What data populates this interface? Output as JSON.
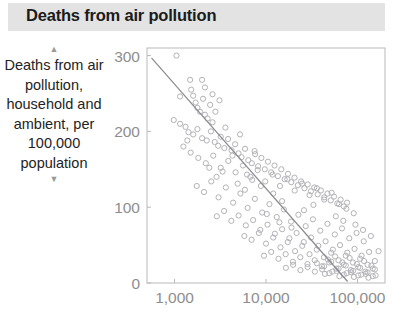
{
  "header": {
    "title": "Deaths from air pollution"
  },
  "axis_caption": {
    "text": "Deaths from air pollution, household and ambient, per 100,000 population",
    "arrow_up": "▲",
    "arrow_down": "▼"
  },
  "colors": {
    "title_band": "#e3e3e3",
    "title_text": "#1b1b1b",
    "tick_label": "#8e8e8e",
    "axis": "#b9b9b9",
    "point": "#b3b3b8",
    "trend_line": "#8a8a90",
    "background": "#ffffff"
  },
  "chart_data": {
    "type": "scatter",
    "title": "Deaths from air pollution",
    "xlabel": "",
    "ylabel": "Deaths from air pollution, household and ambient, per 100,000 population",
    "x_scale": "log",
    "y_scale": "linear",
    "xlim": [
      500,
      200000
    ],
    "ylim": [
      0,
      310
    ],
    "x_ticks": [
      1000,
      10000,
      100000
    ],
    "x_tick_labels": [
      "1,000",
      "10,000",
      "100,000"
    ],
    "y_ticks": [
      0,
      100,
      200,
      300
    ],
    "y_tick_labels": [
      "0",
      "100",
      "200",
      "300"
    ],
    "grid": false,
    "legend": null,
    "trend_line": {
      "type": "linear-in-log-x",
      "x_start": 560,
      "y_start": 297,
      "x_end": 78000,
      "y_end": 2
    },
    "series": [
      {
        "name": "countries",
        "marker": "open-circle",
        "points": [
          [
            1050,
            300
          ],
          [
            1480,
            268
          ],
          [
            1520,
            255
          ],
          [
            1600,
            247
          ],
          [
            1700,
            238
          ],
          [
            1780,
            231
          ],
          [
            1900,
            226
          ],
          [
            2050,
            243
          ],
          [
            2150,
            222
          ],
          [
            2300,
            217
          ],
          [
            2450,
            235
          ],
          [
            2600,
            212
          ],
          [
            980,
            215
          ],
          [
            1150,
            210
          ],
          [
            1320,
            206
          ],
          [
            1420,
            199
          ],
          [
            1600,
            196
          ],
          [
            1780,
            203
          ],
          [
            2000,
            191
          ],
          [
            2250,
            188
          ],
          [
            2500,
            200
          ],
          [
            2750,
            186
          ],
          [
            3000,
            181
          ],
          [
            3200,
            193
          ],
          [
            3500,
            178
          ],
          [
            3850,
            190
          ],
          [
            4200,
            175
          ],
          [
            4600,
            183
          ],
          [
            5000,
            171
          ],
          [
            5400,
            166
          ],
          [
            5900,
            177
          ],
          [
            6400,
            162
          ],
          [
            7000,
            158
          ],
          [
            7600,
            170
          ],
          [
            8200,
            154
          ],
          [
            8900,
            165
          ],
          [
            9700,
            150
          ],
          [
            10500,
            160
          ],
          [
            11400,
            146
          ],
          [
            12400,
            155
          ],
          [
            13500,
            141
          ],
          [
            14700,
            150
          ],
          [
            16000,
            137
          ],
          [
            17400,
            144
          ],
          [
            18900,
            133
          ],
          [
            20500,
            139
          ],
          [
            22300,
            129
          ],
          [
            24200,
            134
          ],
          [
            26300,
            125
          ],
          [
            28600,
            130
          ],
          [
            31000,
            121
          ],
          [
            33700,
            126
          ],
          [
            36700,
            117
          ],
          [
            39800,
            122
          ],
          [
            43300,
            113
          ],
          [
            47000,
            118
          ],
          [
            51000,
            109
          ],
          [
            55400,
            114
          ],
          [
            60200,
            105
          ],
          [
            65400,
            110
          ],
          [
            71000,
            101
          ],
          [
            77000,
            106
          ],
          [
            1250,
            180
          ],
          [
            1500,
            172
          ],
          [
            1820,
            165
          ],
          [
            2200,
            158
          ],
          [
            2650,
            168
          ],
          [
            3200,
            152
          ],
          [
            3870,
            161
          ],
          [
            4650,
            146
          ],
          [
            5600,
            155
          ],
          [
            6750,
            140
          ],
          [
            8100,
            149
          ],
          [
            9800,
            134
          ],
          [
            11800,
            143
          ],
          [
            14200,
            128
          ],
          [
            17100,
            137
          ],
          [
            20600,
            122
          ],
          [
            24800,
            131
          ],
          [
            29900,
            116
          ],
          [
            36000,
            125
          ],
          [
            43300,
            110
          ],
          [
            52200,
            119
          ],
          [
            62900,
            104
          ],
          [
            75700,
            98
          ],
          [
            91000,
            92
          ],
          [
            1750,
            128
          ],
          [
            2100,
            120
          ],
          [
            2520,
            134
          ],
          [
            3030,
            113
          ],
          [
            3640,
            126
          ],
          [
            4370,
            106
          ],
          [
            5250,
            118
          ],
          [
            6300,
            99
          ],
          [
            7560,
            111
          ],
          [
            9080,
            93
          ],
          [
            10900,
            104
          ],
          [
            13100,
            87
          ],
          [
            15700,
            97
          ],
          [
            18800,
            81
          ],
          [
            22600,
            90
          ],
          [
            27200,
            75
          ],
          [
            32600,
            84
          ],
          [
            39200,
            69
          ],
          [
            47000,
            78
          ],
          [
            56500,
            64
          ],
          [
            67800,
            72
          ],
          [
            81400,
            59
          ],
          [
            97700,
            66
          ],
          [
            117000,
            55
          ],
          [
            2900,
            88
          ],
          [
            3480,
            95
          ],
          [
            4180,
            82
          ],
          [
            5020,
            89
          ],
          [
            6020,
            76
          ],
          [
            7230,
            83
          ],
          [
            8670,
            70
          ],
          [
            10400,
            77
          ],
          [
            12500,
            65
          ],
          [
            15000,
            71
          ],
          [
            18000,
            59
          ],
          [
            21600,
            66
          ],
          [
            25900,
            54
          ],
          [
            31100,
            60
          ],
          [
            37300,
            49
          ],
          [
            44800,
            55
          ],
          [
            53800,
            44
          ],
          [
            64500,
            50
          ],
          [
            77400,
            40
          ],
          [
            92900,
            45
          ],
          [
            111000,
            36
          ],
          [
            134000,
            41
          ],
          [
            5800,
            62
          ],
          [
            6960,
            57
          ],
          [
            8350,
            66
          ],
          [
            10000,
            52
          ],
          [
            12000,
            60
          ],
          [
            14400,
            47
          ],
          [
            17300,
            54
          ],
          [
            20800,
            42
          ],
          [
            24900,
            49
          ],
          [
            29900,
            38
          ],
          [
            35900,
            44
          ],
          [
            43000,
            34
          ],
          [
            51600,
            40
          ],
          [
            62000,
            30
          ],
          [
            74400,
            36
          ],
          [
            89200,
            27
          ],
          [
            107000,
            32
          ],
          [
            129000,
            24
          ],
          [
            155000,
            29
          ],
          [
            9500,
            36
          ],
          [
            11400,
            41
          ],
          [
            13700,
            32
          ],
          [
            16400,
            38
          ],
          [
            19700,
            28
          ],
          [
            23700,
            34
          ],
          [
            28400,
            25
          ],
          [
            34100,
            30
          ],
          [
            40900,
            22
          ],
          [
            49100,
            27
          ],
          [
            58900,
            19
          ],
          [
            70700,
            24
          ],
          [
            84800,
            17
          ],
          [
            102000,
            21
          ],
          [
            122000,
            15
          ],
          [
            147000,
            19
          ],
          [
            16500,
            20
          ],
          [
            19800,
            24
          ],
          [
            23800,
            17
          ],
          [
            28500,
            21
          ],
          [
            34200,
            15
          ],
          [
            41100,
            18
          ],
          [
            49300,
            13
          ],
          [
            59200,
            16
          ],
          [
            71000,
            11
          ],
          [
            85200,
            14
          ],
          [
            102000,
            10
          ],
          [
            123000,
            12
          ],
          [
            147000,
            9
          ],
          [
            36000,
            26
          ],
          [
            43200,
            22
          ],
          [
            51800,
            28
          ],
          [
            62200,
            19
          ],
          [
            74600,
            23
          ],
          [
            89500,
            16
          ],
          [
            107000,
            20
          ],
          [
            129000,
            14
          ],
          [
            155000,
            18
          ],
          [
            44000,
            12
          ],
          [
            53000,
            15
          ],
          [
            63500,
            9
          ],
          [
            76200,
            13
          ],
          [
            91500,
            8
          ],
          [
            110000,
            11
          ],
          [
            132000,
            7
          ],
          [
            158000,
            10
          ],
          [
            47500,
            31
          ],
          [
            57000,
            35
          ],
          [
            68400,
            27
          ],
          [
            82100,
            33
          ],
          [
            98500,
            25
          ],
          [
            118000,
            29
          ],
          [
            142000,
            23
          ],
          [
            3600,
            205
          ],
          [
            4300,
            168
          ],
          [
            5200,
            196
          ],
          [
            6200,
            143
          ],
          [
            7500,
            174
          ],
          [
            12000,
            118
          ],
          [
            15000,
            108
          ],
          [
            1150,
            246
          ],
          [
            1380,
            188
          ],
          [
            2800,
            226
          ],
          [
            3350,
            147
          ],
          [
            8800,
            128
          ],
          [
            26000,
            96
          ],
          [
            33000,
            103
          ],
          [
            58000,
            88
          ],
          [
            70000,
            82
          ],
          [
            95000,
            77
          ],
          [
            115000,
            70
          ],
          [
            140000,
            62
          ],
          [
            170000,
            42
          ],
          [
            2400,
            152
          ],
          [
            2880,
            140
          ],
          [
            4900,
            131
          ],
          [
            5880,
            123
          ],
          [
            7060,
            136
          ],
          [
            10200,
            91
          ],
          [
            14000,
            80
          ],
          [
            19000,
            73
          ],
          [
            2000,
            268
          ],
          [
            2150,
            258
          ],
          [
            2600,
            249
          ],
          [
            3100,
            241
          ]
        ]
      }
    ]
  }
}
